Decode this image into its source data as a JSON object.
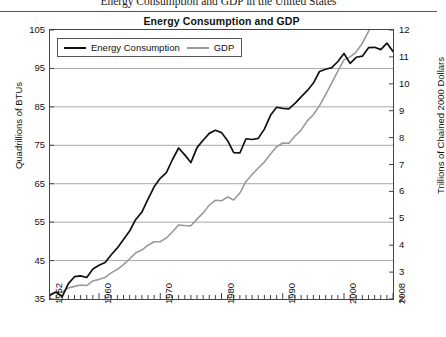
{
  "document": {
    "header_title": "Energy Consumption and GDP in the United States"
  },
  "chart_data": {
    "type": "line",
    "title": "Energy Consumption and GDP",
    "xlabel": "",
    "ylabel": "Quadrillions of BTUs",
    "ylabel_right": "Trillions of Chained 2000 Dollars",
    "grid": true,
    "legend_position": "top-left",
    "xlim": [
      1952,
      2008
    ],
    "ylim": [
      35,
      105
    ],
    "ylim_right": [
      2,
      12
    ],
    "yticks": [
      35,
      45,
      55,
      65,
      75,
      85,
      95,
      105
    ],
    "yticks_right": [
      2,
      3,
      4,
      5,
      6,
      7,
      8,
      9,
      10,
      11,
      12
    ],
    "xticks": [
      1952,
      1960,
      1970,
      1980,
      1990,
      2000,
      2008
    ],
    "xtick_labels": [
      "1952",
      "1960",
      "1970",
      "1980",
      "1990",
      "2000",
      "2008"
    ],
    "x": [
      1952,
      1953,
      1954,
      1955,
      1956,
      1957,
      1958,
      1959,
      1960,
      1961,
      1962,
      1963,
      1964,
      1965,
      1966,
      1967,
      1968,
      1969,
      1970,
      1971,
      1972,
      1973,
      1974,
      1975,
      1976,
      1977,
      1978,
      1979,
      1980,
      1981,
      1982,
      1983,
      1984,
      1985,
      1986,
      1987,
      1988,
      1989,
      1990,
      1991,
      1992,
      1993,
      1994,
      1995,
      1996,
      1997,
      1998,
      1999,
      2000,
      2001,
      2002,
      2003,
      2004,
      2005,
      2006,
      2007,
      2008
    ],
    "series": [
      {
        "name": "Energy Consumption",
        "color": "#111111",
        "axis": "left",
        "units": "Quadrillions of BTUs",
        "values": [
          36.0,
          36.8,
          35.6,
          39.0,
          40.8,
          41.0,
          40.6,
          42.8,
          43.8,
          44.5,
          46.5,
          48.3,
          50.5,
          52.7,
          55.7,
          57.6,
          61.0,
          64.2,
          66.4,
          67.9,
          71.3,
          74.3,
          72.5,
          70.5,
          74.4,
          76.3,
          78.1,
          78.9,
          78.3,
          76.2,
          73.1,
          73.0,
          76.7,
          76.5,
          76.8,
          79.2,
          82.8,
          84.9,
          84.6,
          84.5,
          85.9,
          87.6,
          89.2,
          91.2,
          94.2,
          94.8,
          95.2,
          96.8,
          98.9,
          96.3,
          97.9,
          98.2,
          100.4,
          100.5,
          99.9,
          101.6,
          99.4
        ]
      },
      {
        "name": "GDP",
        "color": "#9a9a9a",
        "axis": "right",
        "units": "Trillions of Chained 2000 Dollars",
        "values": [
          2.17,
          2.27,
          2.25,
          2.41,
          2.47,
          2.52,
          2.5,
          2.67,
          2.73,
          2.8,
          2.97,
          3.1,
          3.28,
          3.49,
          3.72,
          3.82,
          4.0,
          4.13,
          4.13,
          4.27,
          4.5,
          4.75,
          4.73,
          4.72,
          4.97,
          5.2,
          5.49,
          5.67,
          5.65,
          5.79,
          5.68,
          5.94,
          6.37,
          6.63,
          6.87,
          7.09,
          7.39,
          7.66,
          7.8,
          7.79,
          8.06,
          8.28,
          8.62,
          8.85,
          9.19,
          9.6,
          10.03,
          10.47,
          10.89,
          11.0,
          11.19,
          11.51,
          11.95,
          12.33,
          12.7,
          12.99,
          13.04
        ]
      }
    ]
  },
  "legend": {
    "items": [
      {
        "label": "Energy Consumption"
      },
      {
        "label": "GDP"
      }
    ]
  }
}
